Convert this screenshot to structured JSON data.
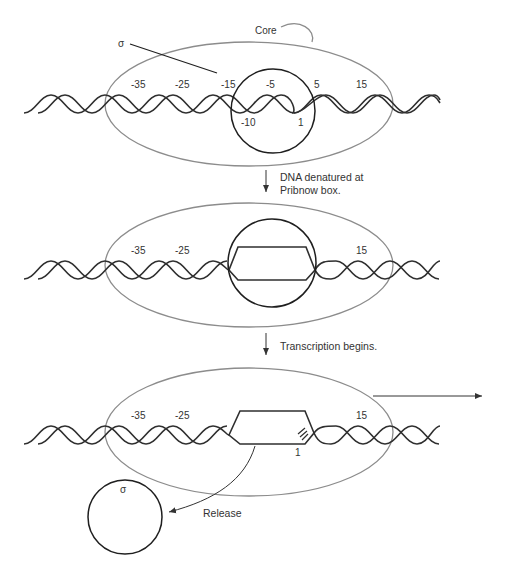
{
  "diagram": {
    "colors": {
      "core": "#8c8c8c",
      "sigma": "#1f1f1f",
      "dna": "#2f2f2f",
      "text": "#333333"
    },
    "panel1": {
      "core_label": "Core",
      "sigma_label": "σ",
      "positions_top": [
        "-35",
        "-25",
        "-15",
        "-5",
        "5",
        "15"
      ],
      "positions_bottom": [
        "-10",
        "1"
      ]
    },
    "step1_caption_line1": "DNA denatured at",
    "step1_caption_line2": "Pribnow box.",
    "panel2": {
      "positions_top": [
        "-35",
        "-25",
        "15"
      ]
    },
    "step2_caption": "Transcription begins.",
    "panel3": {
      "positions_top": [
        "-35",
        "-25",
        "15"
      ],
      "positions_bottom": [
        "1"
      ],
      "sigma_label": "σ",
      "release_label": "Release"
    }
  }
}
